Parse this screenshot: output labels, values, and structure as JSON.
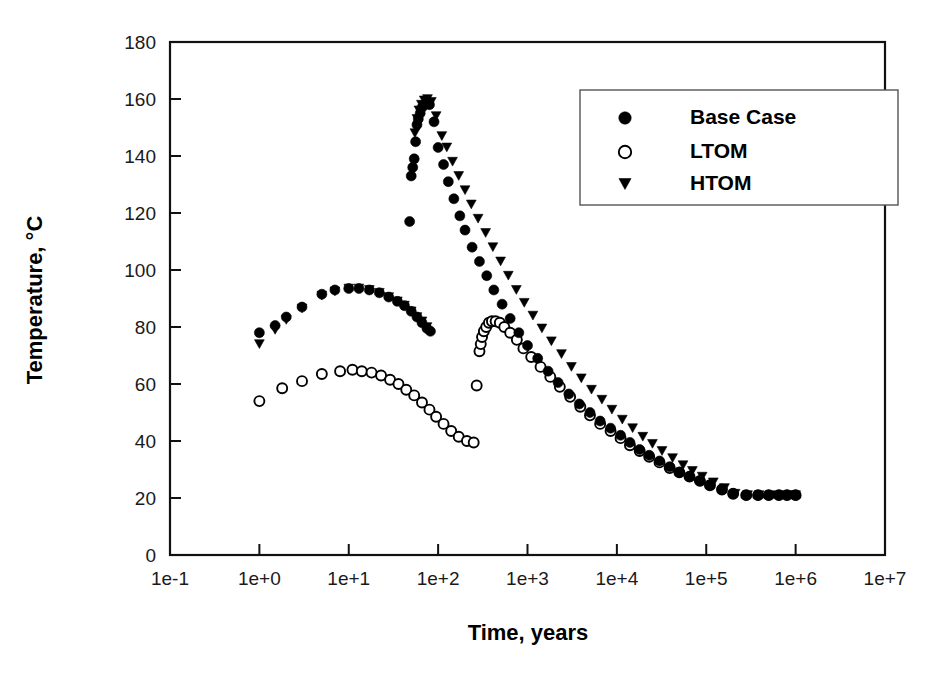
{
  "chart_data": {
    "type": "scatter",
    "title": "",
    "xlabel": "Time, years",
    "ylabel": "Temperature, °C",
    "xscale": "log",
    "yscale": "linear",
    "xlim": [
      0.1,
      10000000
    ],
    "ylim": [
      0,
      180
    ],
    "grid": false,
    "legend_position": "upper-right",
    "x_tick_labels": [
      "1e-1",
      "1e+0",
      "1e+1",
      "1e+2",
      "1e+3",
      "1e+4",
      "1e+5",
      "1e+6",
      "1e+7"
    ],
    "x_tick_values": [
      0.1,
      1,
      10,
      100,
      1000,
      10000,
      100000,
      1000000,
      10000000
    ],
    "y_tick_labels": [
      "0",
      "20",
      "40",
      "60",
      "80",
      "100",
      "120",
      "140",
      "160",
      "180"
    ],
    "y_tick_values": [
      0,
      20,
      40,
      60,
      80,
      100,
      120,
      140,
      160,
      180
    ],
    "legend": [
      {
        "name": "Base Case",
        "marker": "filled-circle"
      },
      {
        "name": "LTOM",
        "marker": "open-circle"
      },
      {
        "name": "HTOM",
        "marker": "filled-triangle-down"
      }
    ],
    "series": [
      {
        "name": "Base Case",
        "marker": "filled-circle",
        "color": "#000000",
        "points": [
          [
            1.0,
            78.0
          ],
          [
            1.5,
            80.5
          ],
          [
            2.0,
            83.5
          ],
          [
            3.0,
            87.0
          ],
          [
            5.0,
            91.5
          ],
          [
            7.0,
            93.0
          ],
          [
            10.0,
            93.5
          ],
          [
            13.0,
            93.5
          ],
          [
            17.0,
            93.0
          ],
          [
            22.0,
            92.0
          ],
          [
            28.0,
            90.5
          ],
          [
            35.0,
            89.0
          ],
          [
            42.0,
            87.5
          ],
          [
            50.0,
            85.5
          ],
          [
            58.0,
            83.5
          ],
          [
            66.0,
            81.5
          ],
          [
            75.0,
            79.5
          ],
          [
            82.0,
            78.5
          ],
          [
            48.0,
            117.0
          ],
          [
            50.0,
            133.0
          ],
          [
            52.0,
            136.0
          ],
          [
            54.0,
            139.0
          ],
          [
            56.0,
            145.0
          ],
          [
            58.0,
            151.0
          ],
          [
            60.0,
            153.0
          ],
          [
            63.0,
            155.0
          ],
          [
            66.0,
            157.0
          ],
          [
            70.0,
            158.0
          ],
          [
            75.0,
            159.0
          ],
          [
            80.0,
            158.0
          ],
          [
            90.0,
            152.0
          ],
          [
            100.0,
            143.0
          ],
          [
            115.0,
            137.0
          ],
          [
            130.0,
            131.0
          ],
          [
            150.0,
            125.0
          ],
          [
            175.0,
            119.0
          ],
          [
            200.0,
            114.0
          ],
          [
            240.0,
            108.0
          ],
          [
            290.0,
            103.0
          ],
          [
            350.0,
            98.0
          ],
          [
            420.0,
            93.0
          ],
          [
            520.0,
            88.0
          ],
          [
            640.0,
            83.0
          ],
          [
            800.0,
            78.0
          ],
          [
            1000.0,
            73.5
          ],
          [
            1300.0,
            69.0
          ],
          [
            1700.0,
            64.5
          ],
          [
            2200.0,
            60.5
          ],
          [
            2900.0,
            56.5
          ],
          [
            3800.0,
            53.0
          ],
          [
            5000.0,
            50.0
          ],
          [
            6500.0,
            47.0
          ],
          [
            8500.0,
            44.5
          ],
          [
            11000.0,
            42.0
          ],
          [
            14000.0,
            39.5
          ],
          [
            18000.0,
            37.0
          ],
          [
            23000.0,
            35.0
          ],
          [
            30000.0,
            33.0
          ],
          [
            39000.0,
            31.0
          ],
          [
            50000.0,
            29.0
          ],
          [
            65000.0,
            27.5
          ],
          [
            85000.0,
            26.0
          ],
          [
            110000.0,
            24.5
          ],
          [
            150000.0,
            23.0
          ],
          [
            200000.0,
            21.5
          ],
          [
            280000.0,
            21.0
          ],
          [
            380000.0,
            21.0
          ],
          [
            500000.0,
            21.0
          ],
          [
            650000.0,
            21.0
          ],
          [
            800000.0,
            21.0
          ],
          [
            1000000.0,
            21.0
          ]
        ]
      },
      {
        "name": "LTOM",
        "marker": "open-circle",
        "color": "#000000",
        "points": [
          [
            1.0,
            54.0
          ],
          [
            1.8,
            58.5
          ],
          [
            3.0,
            61.0
          ],
          [
            5.0,
            63.5
          ],
          [
            8.0,
            64.5
          ],
          [
            11.0,
            65.0
          ],
          [
            14.0,
            64.5
          ],
          [
            18.0,
            64.0
          ],
          [
            23.0,
            63.0
          ],
          [
            29.0,
            61.5
          ],
          [
            36.0,
            60.0
          ],
          [
            44.0,
            58.0
          ],
          [
            54.0,
            56.0
          ],
          [
            66.0,
            53.5
          ],
          [
            80.0,
            51.0
          ],
          [
            95.0,
            48.5
          ],
          [
            115.0,
            46.0
          ],
          [
            140.0,
            43.5
          ],
          [
            170.0,
            41.5
          ],
          [
            210.0,
            40.0
          ],
          [
            250.0,
            39.5
          ],
          [
            270.0,
            59.5
          ],
          [
            290.0,
            71.5
          ],
          [
            300.0,
            74.0
          ],
          [
            310.0,
            76.5
          ],
          [
            325.0,
            78.5
          ],
          [
            345.0,
            80.0
          ],
          [
            370.0,
            81.5
          ],
          [
            400.0,
            82.0
          ],
          [
            440.0,
            82.0
          ],
          [
            490.0,
            81.5
          ],
          [
            550.0,
            80.0
          ],
          [
            640.0,
            78.0
          ],
          [
            760.0,
            75.5
          ],
          [
            900.0,
            72.5
          ],
          [
            1100.0,
            69.5
          ],
          [
            1400.0,
            66.0
          ],
          [
            1800.0,
            62.5
          ],
          [
            2300.0,
            59.0
          ],
          [
            3000.0,
            55.5
          ],
          [
            3900.0,
            52.0
          ],
          [
            5000.0,
            49.0
          ],
          [
            6500.0,
            46.0
          ],
          [
            8500.0,
            43.5
          ],
          [
            11000.0,
            41.0
          ],
          [
            14000.0,
            38.5
          ],
          [
            18000.0,
            36.5
          ],
          [
            23000.0,
            34.5
          ],
          [
            30000.0,
            32.5
          ],
          [
            39000.0,
            30.5
          ],
          [
            50000.0,
            29.0
          ],
          [
            65000.0,
            27.5
          ],
          [
            85000.0,
            26.0
          ],
          [
            110000.0,
            24.5
          ],
          [
            150000.0,
            23.0
          ],
          [
            200000.0,
            21.5
          ],
          [
            280000.0,
            21.0
          ],
          [
            380000.0,
            21.0
          ],
          [
            500000.0,
            21.0
          ],
          [
            650000.0,
            21.0
          ],
          [
            800000.0,
            21.0
          ],
          [
            1000000.0,
            21.0
          ]
        ]
      },
      {
        "name": "HTOM",
        "marker": "filled-triangle-down",
        "color": "#000000",
        "points": [
          [
            1.0,
            74.0
          ],
          [
            1.5,
            79.0
          ],
          [
            2.0,
            82.5
          ],
          [
            3.0,
            86.5
          ],
          [
            5.0,
            91.0
          ],
          [
            7.0,
            92.5
          ],
          [
            10.0,
            93.5
          ],
          [
            13.0,
            93.5
          ],
          [
            17.0,
            93.0
          ],
          [
            22.0,
            92.0
          ],
          [
            28.0,
            90.5
          ],
          [
            35.0,
            89.0
          ],
          [
            42.0,
            87.5
          ],
          [
            50.0,
            85.5
          ],
          [
            58.0,
            83.5
          ],
          [
            66.0,
            82.0
          ],
          [
            75.0,
            80.0
          ],
          [
            55.0,
            148.0
          ],
          [
            58.0,
            153.0
          ],
          [
            61.0,
            156.0
          ],
          [
            65.0,
            158.0
          ],
          [
            70.0,
            159.5
          ],
          [
            76.0,
            160.0
          ],
          [
            84.0,
            159.0
          ],
          [
            95.0,
            154.0
          ],
          [
            110.0,
            147.0
          ],
          [
            125.0,
            143.0
          ],
          [
            145.0,
            138.0
          ],
          [
            170.0,
            133.0
          ],
          [
            200.0,
            128.0
          ],
          [
            235.0,
            123.0
          ],
          [
            280.0,
            118.0
          ],
          [
            340.0,
            113.0
          ],
          [
            410.0,
            108.0
          ],
          [
            500.0,
            103.0
          ],
          [
            610.0,
            98.0
          ],
          [
            750.0,
            93.0
          ],
          [
            920.0,
            88.5
          ],
          [
            1150.0,
            84.0
          ],
          [
            1450.0,
            79.5
          ],
          [
            1850.0,
            75.0
          ],
          [
            2400.0,
            70.5
          ],
          [
            3100.0,
            66.0
          ],
          [
            4000.0,
            62.0
          ],
          [
            5200.0,
            58.0
          ],
          [
            6800.0,
            54.5
          ],
          [
            8800.0,
            51.0
          ],
          [
            11500.0,
            47.5
          ],
          [
            15000.0,
            44.5
          ],
          [
            19500.0,
            41.5
          ],
          [
            25000.0,
            39.0
          ],
          [
            32000.0,
            36.5
          ],
          [
            42000.0,
            34.0
          ],
          [
            55000.0,
            31.5
          ],
          [
            70000.0,
            29.5
          ],
          [
            90000.0,
            27.5
          ],
          [
            120000.0,
            25.5
          ],
          [
            160000.0,
            23.5
          ],
          [
            210000.0,
            21.5
          ],
          [
            290000.0,
            21.0
          ],
          [
            390000.0,
            21.0
          ],
          [
            520000.0,
            21.0
          ],
          [
            680000.0,
            21.0
          ],
          [
            850000.0,
            21.0
          ],
          [
            1000000.0,
            21.0
          ]
        ]
      }
    ]
  }
}
